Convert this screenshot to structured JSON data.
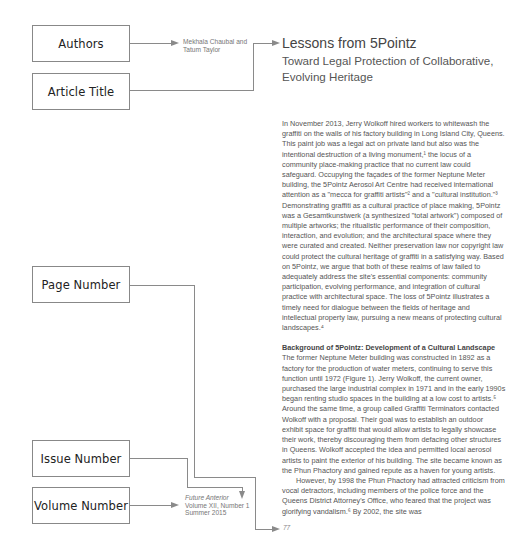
{
  "labels": {
    "authors": "Authors",
    "article_title": "Article Title",
    "page_number": "Page Number",
    "issue_number": "Issue Number",
    "volume_number": "Volume Number"
  },
  "authors_text": {
    "line1": "Mekhala Chaubal and",
    "line2": "Tatum Taylor"
  },
  "article": {
    "title": "Lessons from 5Pointz",
    "subtitle": "Toward Legal Protection of Collaborative, Evolving Heritage",
    "paragraph1": "In November 2013, Jerry Wolkoff hired workers to whitewash the graffiti on the walls of his factory building in Long Island City, Queens. This paint job was a legal act on private land but also was the intentional destruction of a living monument,¹ the locus of a community place-making practice that no current law could safeguard. Occupying the façades of the former Neptune Meter building, the 5Pointz Aerosol Art Centre had received international attention as a \"mecca for graffiti artists\"² and a \"cultural institution.\"³ Demonstrating graffiti as a cultural practice of place making, 5Pointz was a Gesamtkunstwerk (a synthesized \"total artwork\") composed of multiple artworks; the ritualistic performance of their composition, interaction, and evolution; and the architectural space where they were curated and created. Neither preservation law nor copyright law could protect the cultural heritage of graffiti in a satisfying way. Based on 5Pointz, we argue that both of these realms of law failed to adequately address the site's essential components: community participation, evolving performance, and integration of cultural practice with architectural space. The loss of 5Pointz illustrates a timely need for dialogue between the fields of heritage and intellectual property law, pursuing a new means of protecting cultural landscapes.⁴",
    "section_heading": "Background of 5Pointz: Development of a Cultural Landscape",
    "paragraph2": "The former Neptune Meter building was constructed in 1892 as a factory for the production of water meters, continuing to serve this function until 1972 (Figure 1). Jerry Wolkoff, the current owner, purchased the large industrial complex in 1971 and in the early 1990s began renting studio spaces in the building at a low cost to artists.⁵ Around the same time, a group called Graffiti Terminators contacted Wolkoff with a proposal. Their goal was to establish an outdoor exhibit space for graffiti that would allow artists to legally showcase their work, thereby discouraging them from defacing other structures in Queens. Wolkoff accepted the idea and permitted local aerosol artists to paint the exterior of his building. The site became known as the Phun Phactory and gained repute as a haven for young artists.",
    "paragraph3": "However, by 1998 the Phun Phactory had attracted criticism from vocal detractors, including members of the police force and the Queens District Attorney's Office, who feared that the project was glorifying vandalism.⁶ By 2002, the site was"
  },
  "journal_info": {
    "name": "Future Anterior",
    "volume_issue": "Volume XII, Number 1",
    "season": "Summer 2015"
  },
  "page_number": "77",
  "colors": {
    "line": "#8a8a8a",
    "box_border": "#888888",
    "text": "#555555"
  }
}
